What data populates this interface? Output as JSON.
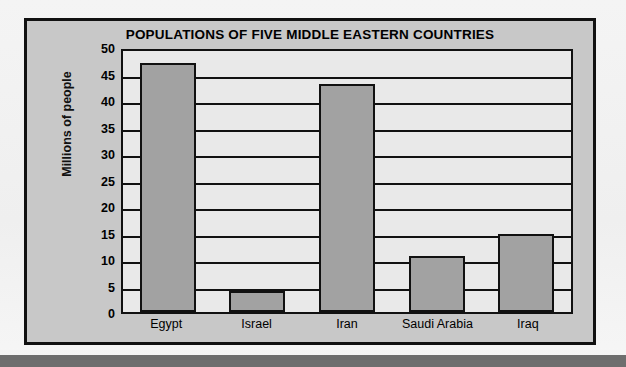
{
  "chart_data": {
    "type": "bar",
    "title": "POPULATIONS OF FIVE MIDDLE EASTERN COUNTRIES",
    "xlabel": "",
    "ylabel": "Millions of people",
    "categories": [
      "Egypt",
      "Israel",
      "Iran",
      "Saudi Arabia",
      "Iraq"
    ],
    "values": [
      47,
      4,
      43,
      10.5,
      14.8
    ],
    "ylim": [
      0,
      50
    ],
    "yticks": [
      0,
      5,
      10,
      15,
      20,
      25,
      30,
      35,
      40,
      45,
      50
    ],
    "ytick_labels": [
      "0",
      "5",
      "10",
      "15",
      "20",
      "25",
      "30",
      "35",
      "40",
      "45",
      "50"
    ],
    "grid": true,
    "legend": false,
    "series": [
      {
        "name": "Population",
        "values": [
          47,
          4,
          43,
          10.5,
          14.8
        ]
      }
    ]
  },
  "colors": {
    "bar_fill": "#a2a2a2",
    "bar_stroke": "#111111",
    "plot_background": "#e9e9e9",
    "figure_background": "#c8c8c8",
    "page_background": "#f2f2f2",
    "bottom_band": "#6e6e6e",
    "text": "#000000"
  }
}
